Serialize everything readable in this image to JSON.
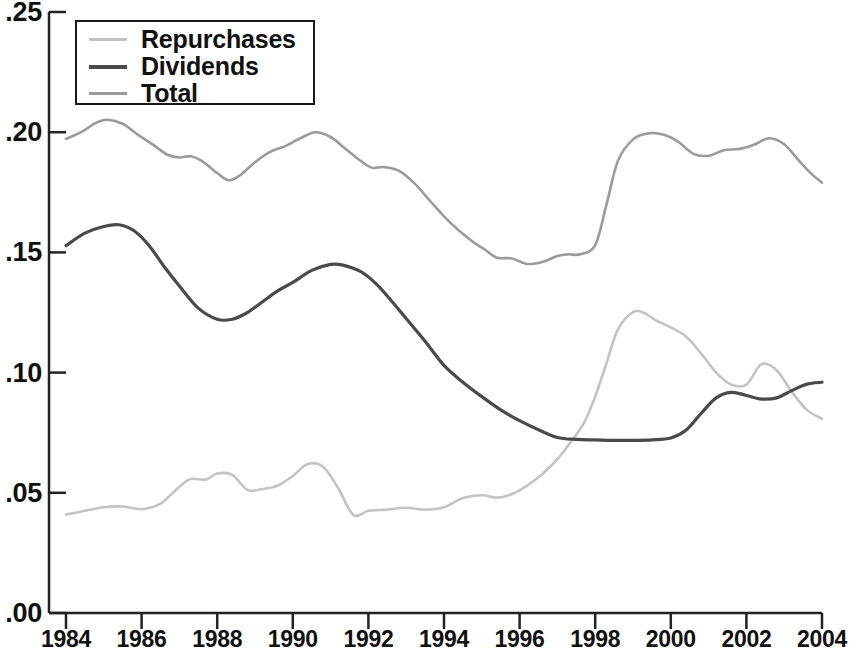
{
  "chart_data": {
    "type": "line",
    "title": "",
    "subtitle": "",
    "xlabel": "",
    "ylabel": "",
    "xlim": [
      1984,
      2004
    ],
    "ylim": [
      0.0,
      0.25
    ],
    "grid": false,
    "legend_position": "top-left",
    "x_tick_labels": [
      "1984",
      "1986",
      "1988",
      "1990",
      "1992",
      "1994",
      "1996",
      "1998",
      "2000",
      "2002",
      "2004"
    ],
    "x_ticks": [
      1984,
      1986,
      1988,
      1990,
      1992,
      1994,
      1996,
      1998,
      2000,
      2002,
      2004
    ],
    "y_tick_labels": [
      ".00",
      ".05",
      ".10",
      ".15",
      ".20",
      ".25"
    ],
    "y_ticks": [
      0.0,
      0.05,
      0.1,
      0.15,
      0.2,
      0.25
    ],
    "series": [
      {
        "name": "Repurchases",
        "color": "#c3c3c3",
        "x": [
          1984.0,
          1984.5,
          1985.0,
          1985.5,
          1986.0,
          1986.5,
          1987.0,
          1987.3,
          1987.7,
          1988.0,
          1988.4,
          1988.8,
          1989.2,
          1989.6,
          1990.0,
          1990.4,
          1990.8,
          1991.2,
          1991.6,
          1992.0,
          1992.5,
          1993.0,
          1993.5,
          1994.0,
          1994.5,
          1995.0,
          1995.4,
          1995.8,
          1996.2,
          1996.6,
          1997.0,
          1997.3,
          1997.7,
          1998.0,
          1998.3,
          1998.6,
          1999.0,
          1999.3,
          1999.6,
          2000.0,
          2000.4,
          2000.8,
          2001.2,
          2001.6,
          2002.0,
          2002.4,
          2002.8,
          2003.2,
          2003.6,
          2004.0
        ],
        "y": [
          0.041,
          0.0425,
          0.044,
          0.0443,
          0.0432,
          0.0455,
          0.0525,
          0.0557,
          0.0555,
          0.058,
          0.0575,
          0.0512,
          0.0516,
          0.053,
          0.057,
          0.062,
          0.0608,
          0.052,
          0.0408,
          0.0425,
          0.043,
          0.0438,
          0.043,
          0.044,
          0.0478,
          0.049,
          0.048,
          0.0495,
          0.053,
          0.0578,
          0.064,
          0.07,
          0.079,
          0.09,
          0.104,
          0.118,
          0.1252,
          0.1248,
          0.1218,
          0.1188,
          0.115,
          0.108,
          0.1,
          0.095,
          0.095,
          0.1035,
          0.101,
          0.092,
          0.0845,
          0.0808
        ]
      },
      {
        "name": "Dividends",
        "color": "#4a4a4a",
        "x": [
          1984.0,
          1984.5,
          1985.0,
          1985.4,
          1985.8,
          1986.2,
          1986.6,
          1987.0,
          1987.5,
          1988.0,
          1988.4,
          1988.8,
          1989.2,
          1989.6,
          1990.0,
          1990.5,
          1991.0,
          1991.3,
          1991.8,
          1992.2,
          1992.6,
          1993.0,
          1993.5,
          1994.0,
          1994.5,
          1995.0,
          1995.5,
          1996.0,
          1996.5,
          1997.0,
          1997.5,
          1998.0,
          1998.5,
          1999.0,
          1999.5,
          2000.0,
          2000.4,
          2000.8,
          2001.2,
          2001.6,
          2002.0,
          2002.4,
          2002.8,
          2003.2,
          2003.6,
          2004.0
        ],
        "y": [
          0.1528,
          0.158,
          0.1608,
          0.1615,
          0.159,
          0.1528,
          0.144,
          0.136,
          0.1268,
          0.1222,
          0.1222,
          0.125,
          0.1295,
          0.134,
          0.1375,
          0.1425,
          0.145,
          0.1448,
          0.142,
          0.137,
          0.13,
          0.1225,
          0.113,
          0.103,
          0.096,
          0.09,
          0.0845,
          0.08,
          0.0762,
          0.073,
          0.0722,
          0.072,
          0.0718,
          0.0718,
          0.072,
          0.0728,
          0.076,
          0.083,
          0.0895,
          0.0918,
          0.0905,
          0.089,
          0.0895,
          0.0925,
          0.0952,
          0.096
        ]
      },
      {
        "name": "Total",
        "color": "#9b9b9b",
        "x": [
          1984.0,
          1984.4,
          1984.8,
          1985.1,
          1985.5,
          1985.9,
          1986.3,
          1986.7,
          1987.0,
          1987.3,
          1987.6,
          1988.0,
          1988.3,
          1988.6,
          1989.0,
          1989.4,
          1989.8,
          1990.2,
          1990.6,
          1991.0,
          1991.4,
          1991.8,
          1992.1,
          1992.4,
          1992.8,
          1993.2,
          1993.6,
          1994.0,
          1994.4,
          1994.8,
          1995.1,
          1995.4,
          1995.8,
          1996.2,
          1996.6,
          1997.0,
          1997.3,
          1997.6,
          1998.0,
          1998.3,
          1998.6,
          1999.0,
          1999.4,
          1999.8,
          2000.2,
          2000.6,
          2001.0,
          2001.4,
          2001.8,
          2002.2,
          2002.6,
          2003.0,
          2003.4,
          2003.7,
          2004.0
        ],
        "y": [
          0.1972,
          0.2,
          0.204,
          0.2052,
          0.2035,
          0.199,
          0.1948,
          0.1905,
          0.1895,
          0.19,
          0.188,
          0.183,
          0.18,
          0.182,
          0.1875,
          0.1918,
          0.1942,
          0.1975,
          0.2,
          0.198,
          0.193,
          0.188,
          0.1852,
          0.1855,
          0.184,
          0.179,
          0.172,
          0.165,
          0.159,
          0.154,
          0.151,
          0.1478,
          0.1475,
          0.1452,
          0.146,
          0.1485,
          0.1492,
          0.1492,
          0.153,
          0.17,
          0.188,
          0.197,
          0.1995,
          0.199,
          0.196,
          0.191,
          0.1902,
          0.1925,
          0.193,
          0.1948,
          0.1975,
          0.195,
          0.188,
          0.183,
          0.179
        ]
      }
    ]
  },
  "legend": {
    "items": [
      {
        "label": "Repurchases"
      },
      {
        "label": "Dividends"
      },
      {
        "label": "Total"
      }
    ]
  },
  "axes": {
    "y_labels": [
      ".25",
      ".20",
      ".15",
      ".10",
      ".05",
      ".00"
    ],
    "x_labels": [
      "1984",
      "1986",
      "1988",
      "1990",
      "1992",
      "1994",
      "1996",
      "1998",
      "2000",
      "2002",
      "2004"
    ]
  }
}
